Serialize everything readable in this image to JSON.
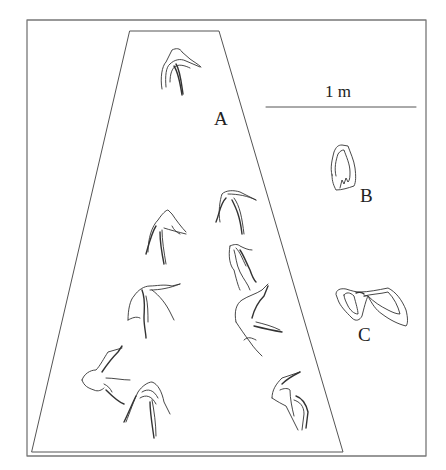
{
  "figure": {
    "scale_bar": {
      "label": "1 m"
    },
    "labels": {
      "a": "A",
      "b": "B",
      "c": "C"
    },
    "colors": {
      "line": "#333333",
      "frame": "#777777",
      "background": "#ffffff"
    }
  }
}
